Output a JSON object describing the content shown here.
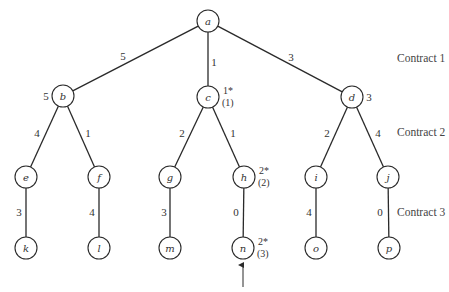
{
  "diagram": {
    "type": "tree",
    "nodes": [
      {
        "id": "a",
        "label": "a",
        "x": 208,
        "y": 21
      },
      {
        "id": "b",
        "label": "b",
        "x": 63,
        "y": 96,
        "side_label": "5",
        "side": "left"
      },
      {
        "id": "c",
        "label": "c",
        "x": 208,
        "y": 97,
        "annot_top": "1*",
        "annot_bottom": "(1)"
      },
      {
        "id": "d",
        "label": "d",
        "x": 352,
        "y": 97,
        "side_label": "3",
        "side": "right"
      },
      {
        "id": "e",
        "label": "e",
        "x": 26,
        "y": 177
      },
      {
        "id": "f",
        "label": "f",
        "x": 99,
        "y": 177
      },
      {
        "id": "g",
        "label": "g",
        "x": 170,
        "y": 177
      },
      {
        "id": "h",
        "label": "h",
        "x": 244,
        "y": 177,
        "annot_top": "2*",
        "annot_bottom": "(2)"
      },
      {
        "id": "i",
        "label": "i",
        "x": 316,
        "y": 177
      },
      {
        "id": "j",
        "label": "j",
        "x": 388,
        "y": 177
      },
      {
        "id": "k",
        "label": "k",
        "x": 26,
        "y": 248
      },
      {
        "id": "l",
        "label": "l",
        "x": 99,
        "y": 248
      },
      {
        "id": "m",
        "label": "m",
        "x": 170,
        "y": 248
      },
      {
        "id": "n",
        "label": "n",
        "x": 243,
        "y": 248,
        "annot_top": "2*",
        "annot_bottom": "(3)"
      },
      {
        "id": "o",
        "label": "o",
        "x": 316,
        "y": 248
      },
      {
        "id": "p",
        "label": "p",
        "x": 389,
        "y": 248
      }
    ],
    "edges": [
      {
        "from": "a",
        "to": "b",
        "weight": "5",
        "lx": 123,
        "ly": 56
      },
      {
        "from": "a",
        "to": "c",
        "weight": "1",
        "lx": 214,
        "ly": 62
      },
      {
        "from": "a",
        "to": "d",
        "weight": "3",
        "lx": 291,
        "ly": 57
      },
      {
        "from": "b",
        "to": "e",
        "weight": "4",
        "lx": 37,
        "ly": 133
      },
      {
        "from": "b",
        "to": "f",
        "weight": "1",
        "lx": 88,
        "ly": 133
      },
      {
        "from": "c",
        "to": "g",
        "weight": "2",
        "lx": 182,
        "ly": 133
      },
      {
        "from": "c",
        "to": "h",
        "weight": "1",
        "lx": 233,
        "ly": 133
      },
      {
        "from": "d",
        "to": "i",
        "weight": "2",
        "lx": 327,
        "ly": 133
      },
      {
        "from": "d",
        "to": "j",
        "weight": "4",
        "lx": 378,
        "ly": 133
      },
      {
        "from": "e",
        "to": "k",
        "weight": "3",
        "lx": 19,
        "ly": 212
      },
      {
        "from": "f",
        "to": "l",
        "weight": "4",
        "lx": 92,
        "ly": 212
      },
      {
        "from": "g",
        "to": "m",
        "weight": "3",
        "lx": 164,
        "ly": 212
      },
      {
        "from": "h",
        "to": "n",
        "weight": "0",
        "lx": 236,
        "ly": 212
      },
      {
        "from": "i",
        "to": "o",
        "weight": "4",
        "lx": 309,
        "ly": 212
      },
      {
        "from": "j",
        "to": "p",
        "weight": "0",
        "lx": 380,
        "ly": 212
      }
    ],
    "levels": [
      {
        "label": "Contract 1",
        "x": 397,
        "y": 58
      },
      {
        "label": "Contract 2",
        "x": 397,
        "y": 132
      },
      {
        "label": "Contract 3",
        "x": 397,
        "y": 212
      }
    ],
    "pointer_arrow": {
      "target": "n",
      "x": 243,
      "y_start": 287,
      "y_end": 265
    },
    "node_radius": 11
  }
}
